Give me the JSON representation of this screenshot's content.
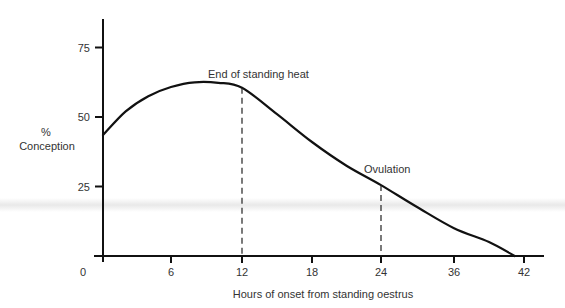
{
  "chart_data": {
    "type": "line",
    "title": "",
    "xlabel": "Hours of onset from standing oestrus",
    "ylabel_line1": "%",
    "ylabel_line2": "Conception",
    "ylabel": "% Conception",
    "x_ticks": [
      0,
      6,
      12,
      18,
      24,
      36,
      42
    ],
    "x_tick_labels": [
      "0",
      "6",
      "12",
      "18",
      "24",
      "36",
      "42"
    ],
    "y_ticks": [
      25,
      50,
      75
    ],
    "y_tick_labels": [
      "25",
      "50",
      "75"
    ],
    "ylim": [
      0,
      85
    ],
    "grid": false,
    "legend": null,
    "series": [
      {
        "name": "% Conception",
        "x": [
          0,
          2,
          4,
          6,
          8,
          10,
          12,
          15,
          18,
          21,
          24,
          30,
          36,
          39,
          41.2
        ],
        "values": [
          43.5,
          52,
          57.5,
          60.8,
          62.5,
          62.3,
          60.5,
          51,
          41,
          32.5,
          25.5,
          17.5,
          10,
          5,
          0
        ]
      }
    ],
    "annotations": [
      {
        "text": "End of standing heat",
        "x": 12,
        "y": 60.5,
        "style": "dashed vertical line to x-axis"
      },
      {
        "text": "Ovulation",
        "x": 24,
        "y": 25.5,
        "style": "dashed vertical line to x-axis"
      }
    ],
    "colors": {
      "line": "#111111",
      "text": "#333333",
      "background": "#ffffff"
    }
  }
}
